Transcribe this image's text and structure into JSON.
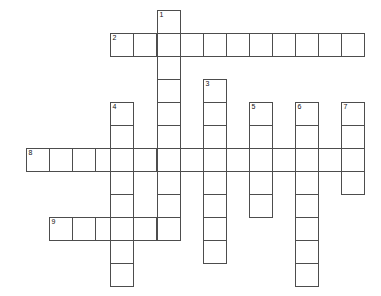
{
  "puzzle": {
    "type": "crossword-grid",
    "title": "Crossword Puzzle Grid",
    "width": 381,
    "height": 296,
    "cell_size": 23,
    "origin": {
      "x": 26,
      "y": 10
    },
    "background_color": "#ffffff",
    "cell_fill_color": "#ffffff",
    "cell_border_color": "#4d4d4d",
    "number_color": "#111111",
    "entries": [
      {
        "number": "1",
        "direction": "down",
        "length": 9,
        "start": {
          "col": 5,
          "row": 0
        },
        "x": 157,
        "y": 10
      },
      {
        "number": "2",
        "direction": "across",
        "length": 11,
        "start": {
          "col": 3,
          "row": 1
        },
        "x": 110,
        "y": 33
      },
      {
        "number": "3",
        "direction": "down",
        "length": 8,
        "start": {
          "col": 7,
          "row": 3
        },
        "x": 203,
        "y": 79
      },
      {
        "number": "4",
        "direction": "down",
        "length": 8,
        "start": {
          "col": 3,
          "row": 4
        },
        "x": 110,
        "y": 102
      },
      {
        "number": "5",
        "direction": "down",
        "length": 5,
        "start": {
          "col": 9,
          "row": 4
        },
        "x": 249,
        "y": 102
      },
      {
        "number": "6",
        "direction": "down",
        "length": 8,
        "start": {
          "col": 11,
          "row": 4
        },
        "x": 295,
        "y": 102
      },
      {
        "number": "7",
        "direction": "down",
        "length": 4,
        "start": {
          "col": 13,
          "row": 4
        },
        "x": 341,
        "y": 102
      },
      {
        "number": "8",
        "direction": "across",
        "length": 15,
        "start": {
          "col": 0,
          "row": 6
        },
        "x": 26,
        "y": 148
      },
      {
        "number": "9",
        "direction": "across",
        "length": 5,
        "start": {
          "col": 1,
          "row": 9
        },
        "x": 49,
        "y": 217
      }
    ],
    "cells": [
      {
        "x": 157,
        "y": 10,
        "number": "1"
      },
      {
        "x": 157,
        "y": 33,
        "number": ""
      },
      {
        "x": 157,
        "y": 56,
        "number": ""
      },
      {
        "x": 157,
        "y": 79,
        "number": ""
      },
      {
        "x": 157,
        "y": 102,
        "number": ""
      },
      {
        "x": 157,
        "y": 125,
        "number": ""
      },
      {
        "x": 157,
        "y": 148,
        "number": ""
      },
      {
        "x": 157,
        "y": 171,
        "number": ""
      },
      {
        "x": 157,
        "y": 194,
        "number": ""
      },
      {
        "x": 110,
        "y": 33,
        "number": "2"
      },
      {
        "x": 133,
        "y": 33,
        "number": ""
      },
      {
        "x": 180,
        "y": 33,
        "number": ""
      },
      {
        "x": 203,
        "y": 33,
        "number": ""
      },
      {
        "x": 226,
        "y": 33,
        "number": ""
      },
      {
        "x": 249,
        "y": 33,
        "number": ""
      },
      {
        "x": 272,
        "y": 33,
        "number": ""
      },
      {
        "x": 295,
        "y": 33,
        "number": ""
      },
      {
        "x": 318,
        "y": 33,
        "number": ""
      },
      {
        "x": 341,
        "y": 33,
        "number": ""
      },
      {
        "x": 203,
        "y": 79,
        "number": "3"
      },
      {
        "x": 203,
        "y": 102,
        "number": ""
      },
      {
        "x": 203,
        "y": 125,
        "number": ""
      },
      {
        "x": 203,
        "y": 171,
        "number": ""
      },
      {
        "x": 203,
        "y": 194,
        "number": ""
      },
      {
        "x": 203,
        "y": 217,
        "number": ""
      },
      {
        "x": 203,
        "y": 240,
        "number": ""
      },
      {
        "x": 110,
        "y": 102,
        "number": "4"
      },
      {
        "x": 110,
        "y": 125,
        "number": ""
      },
      {
        "x": 110,
        "y": 171,
        "number": ""
      },
      {
        "x": 110,
        "y": 194,
        "number": ""
      },
      {
        "x": 110,
        "y": 240,
        "number": ""
      },
      {
        "x": 110,
        "y": 263,
        "number": ""
      },
      {
        "x": 249,
        "y": 102,
        "number": "5"
      },
      {
        "x": 249,
        "y": 125,
        "number": ""
      },
      {
        "x": 249,
        "y": 171,
        "number": ""
      },
      {
        "x": 249,
        "y": 194,
        "number": ""
      },
      {
        "x": 295,
        "y": 102,
        "number": "6"
      },
      {
        "x": 295,
        "y": 125,
        "number": ""
      },
      {
        "x": 295,
        "y": 171,
        "number": ""
      },
      {
        "x": 295,
        "y": 194,
        "number": ""
      },
      {
        "x": 295,
        "y": 217,
        "number": ""
      },
      {
        "x": 295,
        "y": 240,
        "number": ""
      },
      {
        "x": 295,
        "y": 263,
        "number": ""
      },
      {
        "x": 341,
        "y": 102,
        "number": "7"
      },
      {
        "x": 341,
        "y": 125,
        "number": ""
      },
      {
        "x": 341,
        "y": 171,
        "number": ""
      },
      {
        "x": 26,
        "y": 148,
        "number": "8"
      },
      {
        "x": 49,
        "y": 148,
        "number": ""
      },
      {
        "x": 72,
        "y": 148,
        "number": ""
      },
      {
        "x": 95,
        "y": 148,
        "number": ""
      },
      {
        "x": 110,
        "y": 148,
        "number": ""
      },
      {
        "x": 133,
        "y": 148,
        "number": ""
      },
      {
        "x": 157,
        "y": 148,
        "number": ""
      },
      {
        "x": 180,
        "y": 148,
        "number": ""
      },
      {
        "x": 203,
        "y": 148,
        "number": ""
      },
      {
        "x": 226,
        "y": 148,
        "number": ""
      },
      {
        "x": 249,
        "y": 148,
        "number": ""
      },
      {
        "x": 272,
        "y": 148,
        "number": ""
      },
      {
        "x": 295,
        "y": 148,
        "number": ""
      },
      {
        "x": 318,
        "y": 148,
        "number": ""
      },
      {
        "x": 341,
        "y": 148,
        "number": ""
      },
      {
        "x": 49,
        "y": 217,
        "number": "9"
      },
      {
        "x": 72,
        "y": 217,
        "number": ""
      },
      {
        "x": 95,
        "y": 217,
        "number": ""
      },
      {
        "x": 110,
        "y": 217,
        "number": ""
      },
      {
        "x": 133,
        "y": 217,
        "number": ""
      },
      {
        "x": 157,
        "y": 217,
        "number": ""
      }
    ]
  }
}
